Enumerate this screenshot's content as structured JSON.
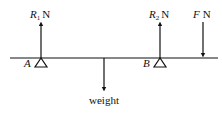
{
  "diagram": {
    "type": "beam-force-diagram",
    "beam": {
      "x1": 10,
      "x2": 218,
      "y": 58
    },
    "supports": [
      {
        "id": "A",
        "label": "A",
        "x": 41
      },
      {
        "id": "B",
        "label": "B",
        "x": 160
      }
    ],
    "forces": [
      {
        "id": "R1",
        "symbol": "R",
        "subscript": "1",
        "unit": "N",
        "direction": "up",
        "x": 41
      },
      {
        "id": "R2",
        "symbol": "R",
        "subscript": "2",
        "unit": "N",
        "direction": "up",
        "x": 160
      },
      {
        "id": "F",
        "symbol": "F",
        "subscript": "",
        "unit": "N",
        "direction": "down",
        "x": 203
      },
      {
        "id": "weight",
        "label": "weight",
        "direction": "down",
        "x": 104
      }
    ],
    "labels": {
      "A": "A",
      "B": "B",
      "R1_symbol": "R",
      "R1_sub": "1",
      "R1_unit": "N",
      "R2_symbol": "R",
      "R2_sub": "2",
      "R2_unit": "N",
      "F_symbol": "F",
      "F_unit": "N",
      "weight": "weight"
    },
    "colors": {
      "stroke": "#111111",
      "background": "#ffffff"
    }
  }
}
